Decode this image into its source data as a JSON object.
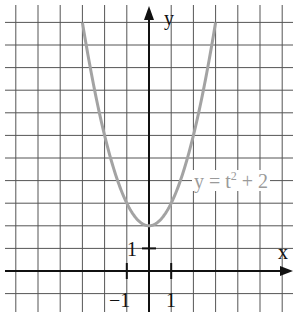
{
  "chart_data": {
    "type": "line",
    "title": "",
    "xlabel": "x",
    "ylabel": "y",
    "series": [
      {
        "name": "y = t^2 + 2",
        "label_text": "y = t² + 2",
        "x": [
          -3,
          -2.5,
          -2,
          -1.5,
          -1,
          -0.5,
          0,
          0.5,
          1,
          1.5,
          2,
          2.5,
          3
        ],
        "values": [
          11,
          8.25,
          6,
          4.25,
          3,
          2.25,
          2,
          2.25,
          3,
          4.25,
          6,
          8.25,
          11
        ],
        "color": "#a0a0a0"
      }
    ],
    "xlim": [
      -6.5,
      6
    ],
    "ylim": [
      -1.5,
      11.5
    ],
    "grid": true,
    "x_ticks": [
      {
        "value": -1,
        "label": "−1"
      },
      {
        "value": 1,
        "label": "1"
      }
    ],
    "y_ticks": [
      {
        "value": 1,
        "label": "1"
      }
    ],
    "legend_position": "none",
    "annotation": {
      "text": "y = t² + 2",
      "x": 2.1,
      "y": 7
    }
  },
  "labels": {
    "y_axis": "y",
    "x_axis": "x",
    "tick_x_neg1": "−1",
    "tick_x_1": "1",
    "tick_y_1": "1",
    "curve_label_base": "y = t",
    "curve_label_exp": "2",
    "curve_label_tail": " + 2"
  },
  "colors": {
    "grid": "#555555",
    "axis": "#111111",
    "curve": "#a3a3a3",
    "curve_label": "#9a9a9a"
  }
}
